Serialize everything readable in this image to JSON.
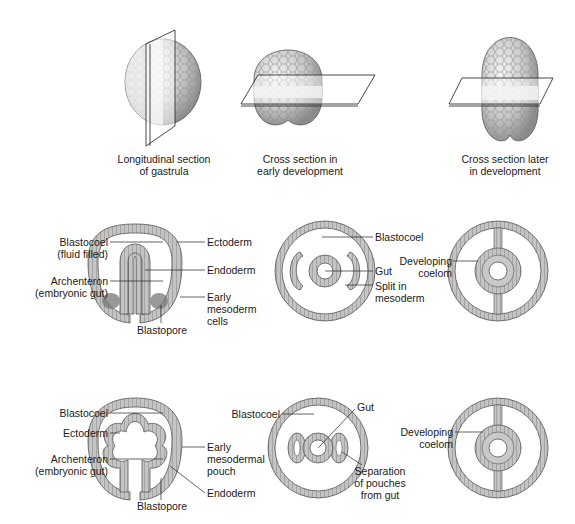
{
  "top_views": [
    {
      "caption": "Longitudinal section\nof gastrula",
      "line1": "Longitudinal section",
      "line2": "of gastrula"
    },
    {
      "caption": "Cross section in\nearly development",
      "line1": "Cross section in",
      "line2": "early development"
    },
    {
      "caption": "Cross section later\nin development",
      "line1": "Cross section later",
      "line2": "in development"
    }
  ],
  "schizocoelous": {
    "title": "SCHIZOCOELOUS PLAN",
    "labels": {
      "blastocoel_1": "Blastocoel",
      "blastocoel_2": "(fluid filled)",
      "archenteron_1": "Archenteron",
      "archenteron_2": "(embryonic gut)",
      "ectoderm": "Ectoderm",
      "endoderm": "Endoderm",
      "mesoderm_1": "Early",
      "mesoderm_2": "mesoderm",
      "mesoderm_3": "cells",
      "blastopore": "Blastopore",
      "cross_blastocoel": "Blastocoel",
      "gut": "Gut",
      "split_1": "Split in",
      "split_2": "mesoderm",
      "coelom_1": "Developing",
      "coelom_2": "coelom"
    }
  },
  "enterocoelous": {
    "title": "ENTEROCOELOUS PLAN",
    "labels": {
      "blastocoel": "Blastocoel",
      "ectoderm": "Ectoderm",
      "archenteron_1": "Archenteron",
      "archenteron_2": "(embryonic gut)",
      "pouch_1": "Early",
      "pouch_2": "mesodermal",
      "pouch_3": "pouch",
      "endoderm": "Endoderm",
      "blastopore": "Blastopore",
      "cross_blastocoel": "Blastocoel",
      "gut": "Gut",
      "separation_1": "Separation",
      "separation_2": "of pouches",
      "separation_3": "from gut",
      "coelom_1": "Developing",
      "coelom_2": "coelom"
    }
  },
  "colors": {
    "header_bar": "#d9d9d9",
    "border": "#a8a8a8",
    "tissue": "#b5b5b5",
    "tissue_dark": "#6e6e6e",
    "embryo_light": "#e8e8e8"
  }
}
